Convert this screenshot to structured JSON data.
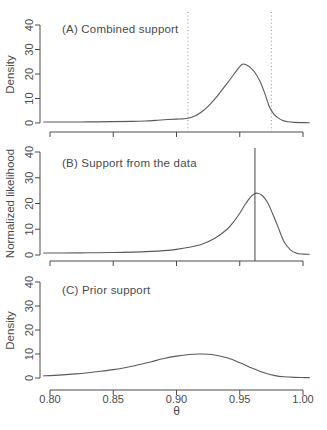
{
  "colors": {
    "background": "#ffffff",
    "curve": "#5a5a5a",
    "axis": "#4a4a4a",
    "text": "#4a4a4a",
    "vline_dotted": "#999999",
    "vline_solid": "#555555"
  },
  "chart_data": [
    {
      "type": "line",
      "panel": "A",
      "title": "(A) Combined support",
      "ylabel": "Density",
      "xlabel": "",
      "xlim": [
        0.8,
        1.0
      ],
      "ylim": [
        0,
        40
      ],
      "xticks": [
        0.8,
        0.85,
        0.9,
        0.95,
        1.0
      ],
      "xtick_labels": [
        "0.80",
        "0.85",
        "0.90",
        "0.95",
        "1.00"
      ],
      "show_xtick_labels": false,
      "yticks": [
        0,
        10,
        20,
        30,
        40
      ],
      "grid": false,
      "legend": null,
      "vlines": [
        {
          "x": 0.909,
          "style": "dotted"
        },
        {
          "x": 0.975,
          "style": "dotted"
        }
      ],
      "series": [
        {
          "name": "posterior density",
          "x": [
            0.795,
            0.81,
            0.83,
            0.85,
            0.865,
            0.875,
            0.885,
            0.893,
            0.9,
            0.905,
            0.909,
            0.915,
            0.92,
            0.925,
            0.93,
            0.935,
            0.94,
            0.945,
            0.949,
            0.952,
            0.955,
            0.958,
            0.962,
            0.966,
            0.97,
            0.9735,
            0.977,
            0.98,
            0.984,
            0.988,
            0.993,
            1.0,
            1.005
          ],
          "y": [
            0.4,
            0.4,
            0.45,
            0.55,
            0.65,
            0.8,
            1.1,
            1.4,
            1.6,
            1.7,
            1.9,
            3.0,
            4.6,
            6.8,
            9.6,
            12.8,
            16.2,
            19.6,
            22.4,
            24.0,
            23.8,
            22.8,
            20.6,
            17.0,
            11.8,
            6.5,
            3.6,
            2.2,
            1.0,
            0.5,
            0.25,
            0.15,
            0.1
          ]
        }
      ]
    },
    {
      "type": "line",
      "panel": "B",
      "title": "(B) Support from the data",
      "ylabel": "Normalized likelihood",
      "xlabel": "",
      "xlim": [
        0.8,
        1.0
      ],
      "ylim": [
        0,
        40
      ],
      "xticks": [
        0.8,
        0.85,
        0.9,
        0.95,
        1.0
      ],
      "xtick_labels": [
        "0.80",
        "0.85",
        "0.90",
        "0.95",
        "1.00"
      ],
      "show_xtick_labels": false,
      "yticks": [
        0,
        10,
        20,
        30,
        40
      ],
      "grid": false,
      "legend": null,
      "vlines": [
        {
          "x": 0.962,
          "style": "solid"
        }
      ],
      "series": [
        {
          "name": "normalized likelihood",
          "x": [
            0.795,
            0.81,
            0.83,
            0.85,
            0.865,
            0.88,
            0.89,
            0.9,
            0.91,
            0.92,
            0.93,
            0.94,
            0.945,
            0.95,
            0.954,
            0.958,
            0.961,
            0.964,
            0.968,
            0.972,
            0.976,
            0.98,
            0.985,
            0.99,
            0.995,
            1.0,
            1.005
          ],
          "y": [
            0.8,
            0.8,
            0.85,
            0.95,
            1.1,
            1.4,
            1.7,
            2.2,
            3.0,
            4.2,
            6.4,
            10.0,
            12.8,
            16.2,
            19.4,
            22.2,
            23.6,
            24.0,
            23.0,
            20.4,
            16.0,
            11.2,
            5.2,
            2.0,
            0.7,
            0.35,
            0.3
          ]
        }
      ]
    },
    {
      "type": "line",
      "panel": "C",
      "title": "(C) Prior support",
      "ylabel": "Density",
      "xlabel": "θ",
      "xlim": [
        0.8,
        1.0
      ],
      "ylim": [
        0,
        40
      ],
      "xticks": [
        0.8,
        0.85,
        0.9,
        0.95,
        1.0
      ],
      "xtick_labels": [
        "0.80",
        "0.85",
        "0.90",
        "0.95",
        "1.00"
      ],
      "show_xtick_labels": true,
      "yticks": [
        0,
        10,
        20,
        30,
        40
      ],
      "grid": false,
      "legend": null,
      "vlines": [],
      "series": [
        {
          "name": "prior density",
          "x": [
            0.795,
            0.8,
            0.81,
            0.82,
            0.83,
            0.84,
            0.85,
            0.86,
            0.87,
            0.88,
            0.89,
            0.9,
            0.91,
            0.918,
            0.925,
            0.93,
            0.94,
            0.95,
            0.96,
            0.97,
            0.978,
            0.985,
            0.993,
            1.0,
            1.005
          ],
          "y": [
            0.9,
            1.0,
            1.3,
            1.7,
            2.2,
            2.8,
            3.5,
            4.4,
            5.5,
            6.8,
            8.1,
            9.1,
            9.8,
            10.0,
            9.9,
            9.6,
            8.4,
            6.4,
            4.1,
            2.1,
            1.0,
            0.5,
            0.25,
            0.18,
            0.15
          ]
        }
      ]
    }
  ]
}
